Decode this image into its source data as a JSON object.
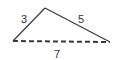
{
  "diagram": {
    "type": "triangle",
    "sides": {
      "left": {
        "label": "3",
        "style": "solid"
      },
      "right": {
        "label": "5",
        "style": "solid"
      },
      "base": {
        "label": "7",
        "style": "dashed"
      }
    },
    "colors": {
      "stroke": "#3a3a3a",
      "text": "#333333",
      "background": "#ffffff"
    }
  }
}
